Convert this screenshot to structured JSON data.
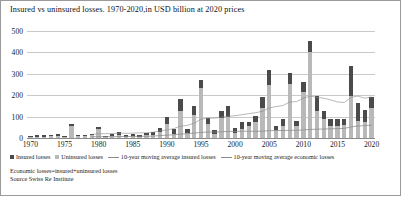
{
  "chart_data": {
    "type": "bar",
    "title": "Insured vs uninsured losses. 1970-2020,in USD billion at 2020 prices",
    "xlabel": "",
    "ylabel": "",
    "ylim": [
      0,
      500
    ],
    "yticks": [
      0,
      100,
      200,
      300,
      400,
      500
    ],
    "xticks": [
      1970,
      1975,
      1980,
      1985,
      1990,
      1995,
      2000,
      2005,
      2010,
      2015,
      2020
    ],
    "grid": true,
    "stacked": true,
    "legend_position": "bottom",
    "categories": [
      1970,
      1971,
      1972,
      1973,
      1974,
      1975,
      1976,
      1977,
      1978,
      1979,
      1980,
      1981,
      1982,
      1983,
      1984,
      1985,
      1986,
      1987,
      1988,
      1989,
      1990,
      1991,
      1992,
      1993,
      1994,
      1995,
      1996,
      1997,
      1998,
      1999,
      2000,
      2001,
      2002,
      2003,
      2004,
      2005,
      2006,
      2007,
      2008,
      2009,
      2010,
      2011,
      2012,
      2013,
      2014,
      2015,
      2016,
      2017,
      2018,
      2019,
      2020
    ],
    "series": [
      {
        "name": "Insured losses",
        "color": "#4b4b4b",
        "values": [
          4,
          7,
          6,
          5,
          7,
          3,
          9,
          5,
          6,
          9,
          7,
          5,
          9,
          13,
          7,
          10,
          6,
          10,
          11,
          20,
          32,
          24,
          53,
          20,
          42,
          35,
          30,
          18,
          35,
          54,
          22,
          34,
          18,
          25,
          52,
          70,
          20,
          33,
          52,
          23,
          45,
          55,
          70,
          36,
          30,
          32,
          27,
          140,
          85,
          55,
          50
        ]
      },
      {
        "name": "Uninsured losses",
        "color": "#b9b9b9",
        "values": [
          6,
          7,
          6,
          8,
          11,
          5,
          55,
          8,
          9,
          12,
          43,
          6,
          10,
          14,
          6,
          10,
          7,
          12,
          15,
          26,
          64,
          18,
          128,
          22,
          108,
          235,
          65,
          18,
          92,
          96,
          23,
          41,
          57,
          76,
          140,
          250,
          36,
          58,
          252,
          58,
          215,
          400,
          125,
          90,
          57,
          58,
          61,
          195,
          78,
          76,
          142
        ]
      }
    ],
    "lines": [
      {
        "name": "10-year moving average insured losses",
        "color": "#8a8a8a",
        "x": [
          1979,
          1980,
          1981,
          1982,
          1983,
          1984,
          1985,
          1986,
          1987,
          1988,
          1989,
          1990,
          1991,
          1992,
          1993,
          1994,
          1995,
          1996,
          1997,
          1998,
          1999,
          2000,
          2001,
          2002,
          2003,
          2004,
          2005,
          2006,
          2007,
          2008,
          2009,
          2010,
          2011,
          2012,
          2013,
          2014,
          2015,
          2016,
          2017,
          2018,
          2019,
          2020
        ],
        "values": [
          6,
          6,
          6,
          6,
          7,
          7,
          7,
          8,
          8,
          9,
          11,
          13,
          15,
          18,
          20,
          23,
          26,
          28,
          28,
          29,
          31,
          31,
          32,
          32,
          31,
          32,
          34,
          35,
          35,
          36,
          36,
          38,
          40,
          41,
          42,
          43,
          44,
          45,
          52,
          56,
          58,
          60
        ]
      },
      {
        "name": "10-year moving average economic losses",
        "color": "#8a8a8a",
        "x": [
          1979,
          1980,
          1981,
          1982,
          1983,
          1984,
          1985,
          1986,
          1987,
          1988,
          1989,
          1990,
          1991,
          1992,
          1993,
          1994,
          1995,
          1996,
          1997,
          1998,
          1999,
          2000,
          2001,
          2002,
          2003,
          2004,
          2005,
          2006,
          2007,
          2008,
          2009,
          2010,
          2011,
          2012,
          2013,
          2014,
          2015,
          2016,
          2017,
          2018,
          2019,
          2020
        ],
        "values": [
          17,
          20,
          20,
          21,
          23,
          22,
          23,
          24,
          25,
          27,
          33,
          38,
          44,
          55,
          59,
          69,
          88,
          93,
          93,
          97,
          102,
          104,
          109,
          114,
          118,
          125,
          140,
          147,
          152,
          168,
          170,
          186,
          196,
          190,
          186,
          178,
          168,
          166,
          190,
          196,
          186,
          192
        ]
      }
    ]
  },
  "legend": {
    "items": [
      {
        "label": "Insured losses",
        "marker": "square"
      },
      {
        "label": "Uninsured losses",
        "marker": "square"
      },
      {
        "label": "10-year moving average insured losses",
        "marker": "line"
      },
      {
        "label": "10-year moving average economic losses",
        "marker": "line"
      }
    ]
  },
  "footer": {
    "note": "Economic losses=insured+uninsured losses",
    "source": "Source Swiss Re Institute"
  }
}
